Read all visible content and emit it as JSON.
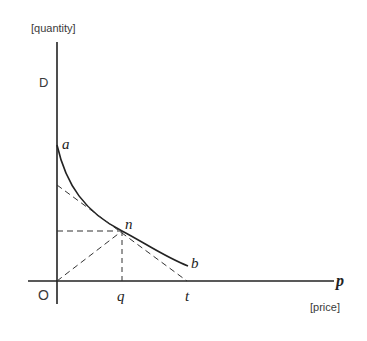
{
  "diagram": {
    "type": "demand-curve-elasticity",
    "axis_labels": {
      "y_axis_unit": "[quantity]",
      "x_axis_unit": "[price]",
      "y_axis_name": "D",
      "x_axis_name": "p",
      "origin": "O"
    },
    "points": {
      "a": "a",
      "n": "n",
      "b": "b",
      "q": "q",
      "t": "t"
    },
    "elements": [
      {
        "name": "demand-curve",
        "from": "a",
        "to": "b",
        "style": "solid"
      },
      {
        "name": "tangent-line",
        "through": "n",
        "meets_x_axis_at": "t",
        "style": "dashed"
      },
      {
        "name": "ray-from-origin",
        "from": "O",
        "to": "n",
        "style": "dashed"
      },
      {
        "name": "horizontal-projection",
        "from": "n",
        "to": "y-axis",
        "style": "dashed"
      },
      {
        "name": "vertical-projection",
        "from": "n",
        "to": "q",
        "style": "dashed"
      }
    ],
    "colors": {
      "line": "#222222",
      "background": "#ffffff"
    }
  }
}
